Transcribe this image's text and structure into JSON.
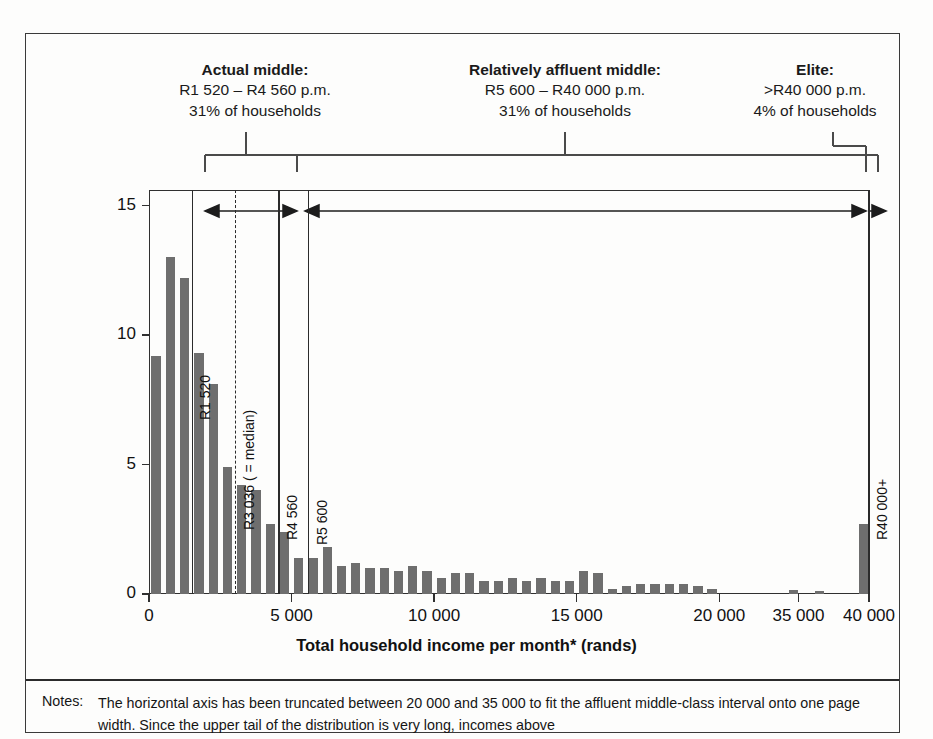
{
  "figure": {
    "x_axis_title": "Total household income per month* (rands)",
    "y_axis_title": "Percentage of households"
  },
  "categories": [
    {
      "id": "actual-middle",
      "title": "Actual middle:",
      "range": "R1 520 – R4 560 p.m.",
      "share": "31% of households"
    },
    {
      "id": "relatively-affluent-middle",
      "title": "Relatively affluent middle:",
      "range": "R5 600 – R40 000 p.m.",
      "share": "31% of households"
    },
    {
      "id": "elite",
      "title": "Elite:",
      "range": ">R40 000 p.m.",
      "share": "4% of households"
    }
  ],
  "markers": [
    {
      "id": "r1520",
      "label": "R1 520",
      "value": 1520,
      "style": "solid"
    },
    {
      "id": "r3036",
      "label": "R3 036 ( = median)",
      "value": 3036,
      "style": "dashed"
    },
    {
      "id": "r4560",
      "label": "R4 560",
      "value": 4560,
      "style": "solid"
    },
    {
      "id": "r5600",
      "label": "R5 600",
      "value": 5600,
      "style": "solid"
    },
    {
      "id": "r40000",
      "label": "R40 000+",
      "value": 40000,
      "style": "solid"
    }
  ],
  "notes": {
    "label": "Notes:",
    "text": "The horizontal axis has been truncated between 20 000 and 35 000 to fit the affluent middle-class interval onto one page width. Since the upper tail of the distribution is very long, incomes above"
  },
  "chart_data": {
    "type": "bar",
    "title": "",
    "xlabel": "Total household income per month* (rands)",
    "ylabel": "Percentage of households",
    "ylim": [
      0,
      15.6
    ],
    "yticks": [
      0,
      5,
      10,
      15
    ],
    "ytick_labels": [
      "0",
      "5",
      "10",
      "15"
    ],
    "xticks": [
      0,
      5000,
      10000,
      15000,
      20000,
      35000,
      40000
    ],
    "xtick_labels": [
      "0",
      "5 000",
      "10 000",
      "15 000",
      "20 000",
      "35 000",
      "40 000"
    ],
    "grid": false,
    "legend": "none",
    "axis_truncated_between": [
      20000,
      35000
    ],
    "bar_color": "#6e6e6e",
    "x": [
      250,
      750,
      1250,
      1750,
      2250,
      2750,
      3250,
      3750,
      4250,
      4750,
      5250,
      5750,
      6250,
      6750,
      7250,
      7750,
      8250,
      8750,
      9250,
      9750,
      10250,
      10750,
      11250,
      11750,
      12250,
      12750,
      13250,
      13750,
      14250,
      14750,
      15250,
      15750,
      16250,
      16750,
      17250,
      17750,
      18250,
      18750,
      19250,
      19750,
      34000,
      36500,
      40000
    ],
    "values": [
      9.2,
      13.0,
      12.2,
      9.3,
      8.1,
      4.9,
      4.2,
      4.0,
      2.7,
      2.4,
      1.4,
      1.4,
      1.8,
      1.1,
      1.2,
      1.0,
      1.0,
      0.9,
      1.1,
      0.9,
      0.6,
      0.8,
      0.8,
      0.5,
      0.5,
      0.6,
      0.5,
      0.6,
      0.5,
      0.5,
      0.9,
      0.8,
      0.2,
      0.3,
      0.4,
      0.4,
      0.4,
      0.4,
      0.3,
      0.2,
      0.15,
      0.12,
      2.7
    ]
  }
}
